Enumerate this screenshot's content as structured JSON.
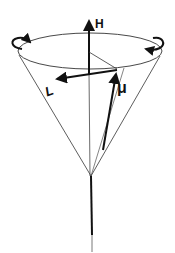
{
  "diagram": {
    "labels": {
      "field": "H",
      "magnetic_moment": "μ",
      "angular_momentum": "L"
    },
    "colors": {
      "stroke": "#111111",
      "background": "#ffffff"
    }
  }
}
